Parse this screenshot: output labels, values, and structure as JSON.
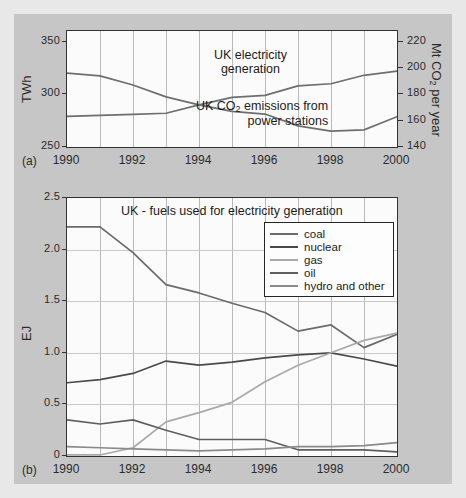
{
  "figure": {
    "background_color": "#c6c6c6",
    "plot_background_color": "#fbfbfb"
  },
  "chart_data": [
    {
      "id": "chart-a",
      "panel_letter": "(a)",
      "type": "line",
      "title": "",
      "xlabel": "",
      "ylabel": "TWh",
      "ylabel_right": "Mt CO2 per year",
      "ylabel_right_parts": {
        "pre": "Mt CO",
        "sub": "2",
        "post": " per year"
      },
      "x": [
        1990,
        1991,
        1992,
        1993,
        1994,
        1995,
        1996,
        1997,
        1998,
        1999,
        2000
      ],
      "xticks": [
        1990,
        1992,
        1994,
        1996,
        1998,
        2000
      ],
      "xticklabels": [
        "1990",
        "1992",
        "1994",
        "1996",
        "1998",
        "2000"
      ],
      "xlim": [
        1990,
        2000
      ],
      "ylim": [
        250,
        360
      ],
      "yticks": [
        250,
        300,
        350
      ],
      "yticklabels": [
        "250",
        "300",
        "350"
      ],
      "ylim_right": [
        140,
        228
      ],
      "yticks_right": [
        140,
        160,
        180,
        200,
        220
      ],
      "yticklabels_right": [
        "140",
        "160",
        "180",
        "200",
        "220"
      ],
      "grid": "vertical",
      "series": [
        {
          "name": "UK CO2 emissions from power stations",
          "label_lines": [
            "UK CO2 emissions from",
            "power stations"
          ],
          "axis": "right",
          "color": "#6e6e6e",
          "values": [
            196,
            194,
            187,
            178,
            172,
            167,
            165,
            156,
            152,
            153,
            163
          ]
        },
        {
          "name": "UK electricity generation",
          "label_lines": [
            "UK electricity",
            "generation"
          ],
          "axis": "left",
          "color": "#6e6e6e",
          "values": [
            279,
            280,
            281,
            282,
            290,
            297,
            299,
            308,
            310,
            318,
            322
          ]
        }
      ],
      "annotations": [
        {
          "text_lines": [
            "UK electricity",
            "generation"
          ]
        },
        {
          "text_lines": [
            "UK CO2 emissions from",
            "power stations"
          ]
        }
      ]
    },
    {
      "id": "chart-b",
      "panel_letter": "(b)",
      "type": "line",
      "title": "UK - fuels used for electricity generation",
      "xlabel": "",
      "ylabel": "EJ",
      "x": [
        1990,
        1991,
        1992,
        1993,
        1994,
        1995,
        1996,
        1997,
        1998,
        1999,
        2000
      ],
      "xticks": [
        1990,
        1992,
        1994,
        1996,
        1998,
        2000
      ],
      "xticklabels": [
        "1990",
        "1992",
        "1994",
        "1996",
        "1998",
        "2000"
      ],
      "xlim": [
        1990,
        2000
      ],
      "ylim": [
        0,
        2.5
      ],
      "yticks": [
        0,
        0.5,
        1.0,
        1.5,
        2.0,
        2.5
      ],
      "yticklabels": [
        "0",
        "0.5",
        "1.0",
        "1.5",
        "2.0",
        "2.5"
      ],
      "grid": "both",
      "legend_position": "upper-right",
      "series": [
        {
          "name": "coal",
          "color": "#6b6b6b",
          "values": [
            2.22,
            2.22,
            1.97,
            1.66,
            1.58,
            1.48,
            1.39,
            1.21,
            1.27,
            1.05,
            1.18
          ]
        },
        {
          "name": "nuclear",
          "color": "#4a4a4a",
          "values": [
            0.71,
            0.74,
            0.8,
            0.92,
            0.88,
            0.91,
            0.95,
            0.98,
            1.0,
            0.94,
            0.87
          ]
        },
        {
          "name": "gas",
          "color": "#a9a9a9",
          "values": [
            0.01,
            0.01,
            0.08,
            0.33,
            0.42,
            0.52,
            0.72,
            0.88,
            1.0,
            1.12,
            1.19
          ]
        },
        {
          "name": "oil",
          "color": "#5f5f5f",
          "values": [
            0.35,
            0.31,
            0.35,
            0.25,
            0.16,
            0.16,
            0.16,
            0.06,
            0.06,
            0.06,
            0.04
          ]
        },
        {
          "name": "hydro and other",
          "color": "#8a8a8a",
          "values": [
            0.09,
            0.08,
            0.07,
            0.06,
            0.05,
            0.06,
            0.07,
            0.09,
            0.09,
            0.1,
            0.13
          ]
        }
      ]
    }
  ]
}
